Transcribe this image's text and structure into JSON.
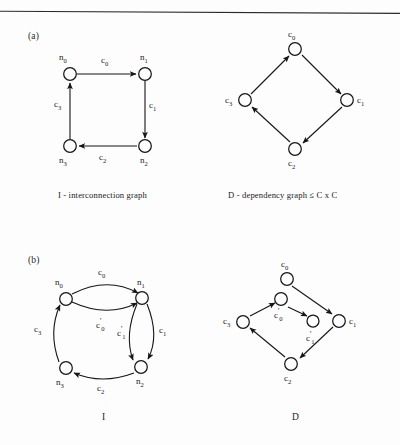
{
  "page": {
    "background": "#fdfdfd",
    "ink": "#1a1a1a",
    "width": 400,
    "height": 445
  },
  "top_rule": {
    "name": "horizontal-rule",
    "color": "#2b2b2b"
  },
  "panels": [
    {
      "id": "a",
      "label": "(a)"
    },
    {
      "id": "b",
      "label": "(b)"
    }
  ],
  "captions": {
    "a_left": "I - interconnection graph",
    "a_right": "D - dependency graph  ≤  C x C",
    "b_left": "I",
    "b_right": "D"
  },
  "graphs": {
    "a_interconnection": {
      "title": "I - interconnection graph",
      "kind": "directed-graph",
      "nodes": [
        {
          "id": "n0",
          "label": "n",
          "sub": "0"
        },
        {
          "id": "n1",
          "label": "n",
          "sub": "1"
        },
        {
          "id": "n2",
          "label": "n",
          "sub": "2"
        },
        {
          "id": "n3",
          "label": "n",
          "sub": "3"
        }
      ],
      "edges": [
        {
          "from": "n0",
          "to": "n1",
          "label": "c",
          "sub": "0"
        },
        {
          "from": "n1",
          "to": "n2",
          "label": "c",
          "sub": "1"
        },
        {
          "from": "n2",
          "to": "n3",
          "label": "c",
          "sub": "2"
        },
        {
          "from": "n3",
          "to": "n0",
          "label": "c",
          "sub": "3"
        }
      ]
    },
    "a_dependency": {
      "title": "D - dependency graph  ≤  C x C",
      "kind": "directed-graph",
      "nodes": [
        {
          "id": "c0",
          "label": "c",
          "sub": "0"
        },
        {
          "id": "c1",
          "label": "c",
          "sub": "1"
        },
        {
          "id": "c2",
          "label": "c",
          "sub": "2"
        },
        {
          "id": "c3",
          "label": "c",
          "sub": "3"
        }
      ],
      "edges": [
        {
          "from": "c0",
          "to": "c1"
        },
        {
          "from": "c1",
          "to": "c2"
        },
        {
          "from": "c2",
          "to": "c3"
        },
        {
          "from": "c3",
          "to": "c0"
        }
      ]
    },
    "b_interconnection": {
      "title": "I",
      "kind": "directed-multigraph",
      "nodes": [
        {
          "id": "n0",
          "label": "n",
          "sub": "0"
        },
        {
          "id": "n1",
          "label": "n",
          "sub": "1"
        },
        {
          "id": "n2",
          "label": "n",
          "sub": "2"
        },
        {
          "id": "n3",
          "label": "n",
          "sub": "3"
        }
      ],
      "edges": [
        {
          "from": "n0",
          "to": "n1",
          "label": "c",
          "sub": "0",
          "prime": false
        },
        {
          "from": "n0",
          "to": "n1",
          "label": "c",
          "sub": "0",
          "prime": true
        },
        {
          "from": "n1",
          "to": "n2",
          "label": "c",
          "sub": "1",
          "prime": true
        },
        {
          "from": "n1",
          "to": "n2",
          "label": "c",
          "sub": "1",
          "prime": false
        },
        {
          "from": "n2",
          "to": "n3",
          "label": "c",
          "sub": "2",
          "prime": false
        },
        {
          "from": "n3",
          "to": "n0",
          "label": "c",
          "sub": "3",
          "prime": false
        }
      ]
    },
    "b_dependency": {
      "title": "D",
      "kind": "directed-graph",
      "nodes": [
        {
          "id": "c0",
          "label": "c",
          "sub": "0",
          "prime": false
        },
        {
          "id": "c0p",
          "label": "c",
          "sub": "0",
          "prime": true
        },
        {
          "id": "c1p",
          "label": "c",
          "sub": "1",
          "prime": true
        },
        {
          "id": "c1",
          "label": "c",
          "sub": "1",
          "prime": false
        },
        {
          "id": "c2",
          "label": "c",
          "sub": "2",
          "prime": false
        },
        {
          "id": "c3",
          "label": "c",
          "sub": "3",
          "prime": false
        }
      ],
      "edges": [
        {
          "from": "c0",
          "to": "c1"
        },
        {
          "from": "c0p",
          "to": "c1p"
        },
        {
          "from": "c1",
          "to": "c2"
        },
        {
          "from": "c2",
          "to": "c3"
        },
        {
          "from": "c3",
          "to": "c0p"
        }
      ]
    }
  },
  "labels": {
    "a_I": {
      "n0": "n",
      "n0s": "0",
      "n1": "n",
      "n1s": "1",
      "n2": "n",
      "n2s": "2",
      "n3": "n",
      "n3s": "3",
      "e_c0": "c",
      "e_c0s": "0",
      "e_c1": "c",
      "e_c1s": "1",
      "e_c2": "c",
      "e_c2s": "2",
      "e_c3": "c",
      "e_c3s": "3"
    },
    "a_D": {
      "c0": "c",
      "c0s": "0",
      "c1": "c",
      "c1s": "1",
      "c2": "c",
      "c2s": "2",
      "c3": "c",
      "c3s": "3"
    },
    "b_I": {
      "n0": "n",
      "n0s": "0",
      "n1": "n",
      "n1s": "1",
      "n2": "n",
      "n2s": "2",
      "n3": "n",
      "n3s": "3",
      "e_c0": "c",
      "e_c0s": "0",
      "e_c0p": "c",
      "e_c0ps": "0",
      "e_c0pm": "'",
      "e_c1p": "c",
      "e_c1ps": "1",
      "e_c1pm": "'",
      "e_c1": "c",
      "e_c1s": "1",
      "e_c2": "c",
      "e_c2s": "2",
      "e_c3": "c",
      "e_c3s": "3"
    },
    "b_D": {
      "c0": "c",
      "c0s": "0",
      "c0p": "c",
      "c0ps": "0",
      "c0pm": "'",
      "c1p": "c",
      "c1ps": "1",
      "c1pm": "'",
      "c1": "c",
      "c1s": "1",
      "c2": "c",
      "c2s": "2",
      "c3": "c",
      "c3s": "3"
    }
  }
}
